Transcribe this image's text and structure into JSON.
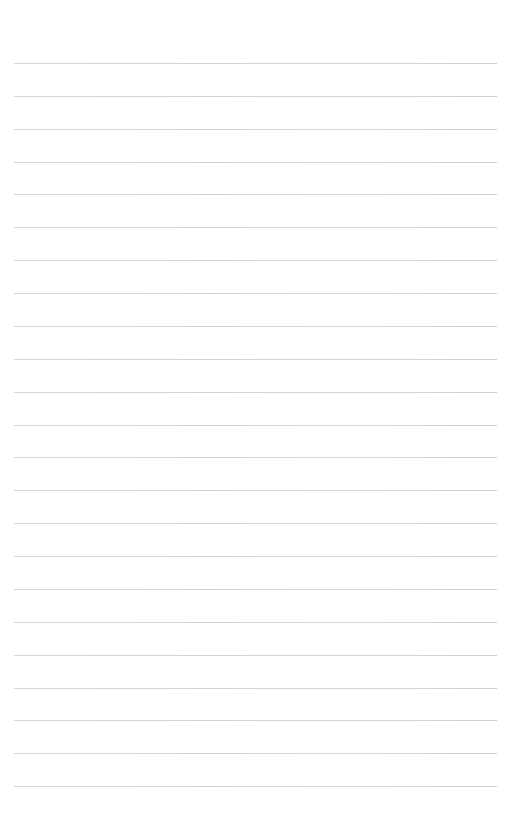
{
  "page": {
    "type": "lined-paper",
    "background_color": "#ffffff",
    "line_color": "#d0d0d0",
    "line_count": 23,
    "first_line_y": 63,
    "line_spacing": 32.87,
    "line_left": 14,
    "line_right": 497
  }
}
